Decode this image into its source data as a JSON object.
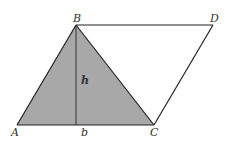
{
  "diagram": {
    "colors": {
      "fill": "#a8a8a8",
      "stroke": "#222222",
      "label": "#333333",
      "background": "#ffffff"
    },
    "points": {
      "A": {
        "label": "A",
        "x": 17,
        "y": 125
      },
      "B": {
        "label": "B",
        "x": 76,
        "y": 25
      },
      "C": {
        "label": "C",
        "x": 154,
        "y": 125
      },
      "D": {
        "label": "D",
        "x": 213,
        "y": 25
      }
    },
    "labels": {
      "A": "A",
      "B": "B",
      "C": "C",
      "D": "D",
      "h": "h",
      "b": "b"
    },
    "shaded_region": "triangle ABC",
    "altitude": {
      "from": "B",
      "to_x": 76,
      "to_y": 125,
      "label": "h"
    },
    "base_label": "b"
  }
}
